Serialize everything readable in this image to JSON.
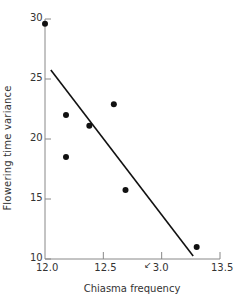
{
  "chart_data": {
    "type": "scatter",
    "title": "",
    "xlabel": "Chiasma frequency",
    "ylabel": "Flowering time variance",
    "xlim": [
      12.0,
      13.5
    ],
    "ylim": [
      10,
      30
    ],
    "x_ticks": [
      12.0,
      12.5,
      13.0,
      13.5
    ],
    "x_tick_labels": [
      "12.0",
      "12.5",
      "3.0",
      "13.5"
    ],
    "y_ticks": [
      10,
      15,
      20,
      25,
      30
    ],
    "y_tick_labels": [
      "10",
      "15",
      "20",
      "25",
      "30"
    ],
    "grid": false,
    "legend": null,
    "annotation": "↙ (pencil mark near 3.0 tick)",
    "points": [
      {
        "x": 12.0,
        "y": 29.6
      },
      {
        "x": 12.18,
        "y": 22.0
      },
      {
        "x": 12.18,
        "y": 18.5
      },
      {
        "x": 12.38,
        "y": 21.1
      },
      {
        "x": 12.59,
        "y": 22.9
      },
      {
        "x": 12.69,
        "y": 15.75
      },
      {
        "x": 13.3,
        "y": 11.0
      }
    ],
    "regression_line": {
      "x": [
        12.05,
        13.27
      ],
      "y": [
        25.75,
        10.25
      ]
    }
  },
  "labels": {
    "xlabel": "Chiasma frequency",
    "ylabel": "Flowering time variance",
    "annotation": "↙"
  },
  "colors": {
    "axis": "#888888",
    "point": "#111111",
    "line": "#111111",
    "text": "#333333"
  }
}
